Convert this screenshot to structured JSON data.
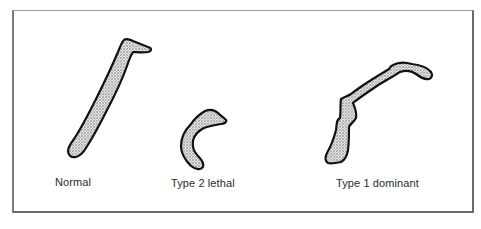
{
  "figure": {
    "specimens": [
      {
        "id": "normal",
        "label": "Normal",
        "shape-icon": "long-bone-icon"
      },
      {
        "id": "type2",
        "label": "Type 2 lethal",
        "shape-icon": "curved-short-bone-icon"
      },
      {
        "id": "type1",
        "label": "Type 1 dominant",
        "shape-icon": "bent-bone-icon"
      }
    ],
    "colors": {
      "outline": "#111111",
      "fill_stipple": "#b8b8b8",
      "frame": "#7a7a7a",
      "text": "#2a2a2a"
    }
  }
}
